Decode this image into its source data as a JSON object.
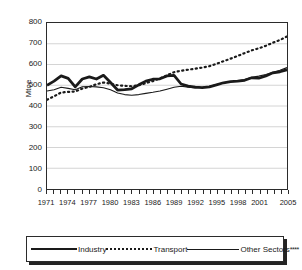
{
  "chart_data": {
    "type": "line",
    "title": "",
    "xlabel": "",
    "ylabel": "Mtoe",
    "ylim": [
      0,
      800
    ],
    "ytick_labels": [
      "800",
      "700",
      "600",
      "500",
      "400",
      "300",
      "200",
      "100",
      "0"
    ],
    "ytick_values": [
      800,
      700,
      600,
      500,
      400,
      300,
      200,
      100,
      0
    ],
    "grid": true,
    "legend_position": "below-chart",
    "x": [
      1971,
      1972,
      1973,
      1974,
      1975,
      1976,
      1977,
      1978,
      1979,
      1980,
      1981,
      1982,
      1983,
      1984,
      1985,
      1986,
      1987,
      1988,
      1989,
      1990,
      1991,
      1992,
      1993,
      1994,
      1995,
      1996,
      1997,
      1998,
      1999,
      2000,
      2001,
      2002,
      2003,
      2004,
      2005
    ],
    "xtick_labels": [
      "1971",
      "1974",
      "1977",
      "1980",
      "1983",
      "1986",
      "1989",
      "1992",
      "1995",
      "1998",
      "2001",
      "2005"
    ],
    "xtick_values": [
      1971,
      1974,
      1977,
      1980,
      1983,
      1986,
      1989,
      1992,
      1995,
      1998,
      2001,
      2005
    ],
    "series": [
      {
        "name": "Industry",
        "style": "solid-thick",
        "values": [
          500,
          520,
          545,
          533,
          492,
          530,
          540,
          530,
          548,
          513,
          477,
          479,
          483,
          502,
          520,
          529,
          531,
          545,
          548,
          506,
          496,
          491,
          489,
          492,
          502,
          512,
          517,
          520,
          524,
          536,
          534,
          545,
          560,
          565,
          575
        ]
      },
      {
        "name": "Transport",
        "style": "dotted",
        "values": [
          430,
          447,
          465,
          468,
          470,
          484,
          492,
          505,
          513,
          508,
          500,
          497,
          495,
          500,
          510,
          520,
          533,
          548,
          563,
          570,
          575,
          580,
          585,
          592,
          603,
          616,
          628,
          641,
          655,
          668,
          678,
          690,
          705,
          718,
          735
        ]
      },
      {
        "name": "Other Sectors****",
        "style": "solid-thin",
        "values": [
          472,
          478,
          490,
          485,
          478,
          493,
          494,
          492,
          488,
          478,
          463,
          455,
          452,
          455,
          461,
          466,
          472,
          481,
          490,
          495,
          491,
          487,
          490,
          495,
          503,
          512,
          517,
          522,
          528,
          538,
          544,
          552,
          563,
          572,
          585
        ]
      }
    ]
  },
  "legend": {
    "items": [
      {
        "label": "Industry",
        "style": "solid-thick"
      },
      {
        "label": "Transport",
        "style": "dotted"
      },
      {
        "label": "Other Sectors",
        "superscript": "****",
        "style": "solid-thin"
      }
    ]
  }
}
